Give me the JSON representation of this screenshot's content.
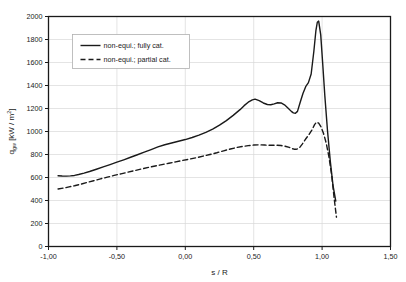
{
  "chart_data": {
    "type": "line",
    "title": "",
    "xlabel": "s / R",
    "ylabel": "q_gw [kW / m^2]",
    "ylabel_main": "q",
    "ylabel_sub": "gw",
    "ylabel_unit_open": " [kW / m",
    "ylabel_unit_sup": "2",
    "ylabel_unit_close": "]",
    "xlim": [
      -1.0,
      1.5
    ],
    "ylim": [
      0,
      2000
    ],
    "grid": true,
    "grid_color": "#d9d9d9",
    "axis_color": "#1a1a1a",
    "background": "#ffffff",
    "legend_position": "upper-left-inside",
    "xticks": [
      -1.0,
      -0.5,
      0.0,
      0.5,
      1.0,
      1.5
    ],
    "xticklabels": [
      "-1,00",
      "-0,50",
      "0,00",
      "0,50",
      "1,00",
      "1,50"
    ],
    "yticks": [
      0,
      200,
      400,
      600,
      800,
      1000,
      1200,
      1400,
      1600,
      1800,
      2000
    ],
    "yticklabels": [
      "0",
      "200",
      "400",
      "600",
      "800",
      "1000",
      "1200",
      "1400",
      "1600",
      "1800",
      "2000"
    ],
    "series": [
      {
        "name": "non-equi.; fully cat.",
        "style": "solid",
        "color": "#1a1a1a",
        "width": 1.4,
        "x": [
          -0.93,
          -0.9,
          -0.87,
          -0.84,
          -0.81,
          -0.78,
          -0.74,
          -0.7,
          -0.65,
          -0.6,
          -0.55,
          -0.5,
          -0.45,
          -0.4,
          -0.35,
          -0.3,
          -0.25,
          -0.2,
          -0.15,
          -0.1,
          -0.05,
          0.0,
          0.05,
          0.1,
          0.15,
          0.2,
          0.25,
          0.3,
          0.35,
          0.4,
          0.43,
          0.46,
          0.49,
          0.51,
          0.54,
          0.57,
          0.6,
          0.625,
          0.65,
          0.675,
          0.7,
          0.725,
          0.75,
          0.775,
          0.79,
          0.805,
          0.82,
          0.84,
          0.86,
          0.88,
          0.9,
          0.92,
          0.94,
          0.955,
          0.965,
          0.975,
          0.99,
          1.005,
          1.02,
          1.04,
          1.06,
          1.08,
          1.1
        ],
        "y": [
          615,
          613,
          612,
          614,
          618,
          626,
          638,
          652,
          672,
          692,
          712,
          733,
          754,
          776,
          798,
          820,
          843,
          866,
          885,
          900,
          915,
          930,
          948,
          968,
          992,
          1020,
          1055,
          1095,
          1140,
          1190,
          1225,
          1255,
          1275,
          1281,
          1268,
          1248,
          1235,
          1233,
          1240,
          1250,
          1248,
          1232,
          1205,
          1175,
          1162,
          1158,
          1175,
          1255,
          1330,
          1390,
          1425,
          1500,
          1700,
          1880,
          1950,
          1960,
          1840,
          1580,
          1310,
          1000,
          740,
          530,
          395
        ]
      },
      {
        "name": "non-equi.; partial cat.",
        "style": "dashed",
        "color": "#1a1a1a",
        "width": 1.4,
        "dash": "5,3",
        "x": [
          -0.93,
          -0.89,
          -0.85,
          -0.81,
          -0.77,
          -0.72,
          -0.67,
          -0.62,
          -0.57,
          -0.52,
          -0.47,
          -0.42,
          -0.37,
          -0.32,
          -0.27,
          -0.22,
          -0.17,
          -0.12,
          -0.07,
          -0.02,
          0.03,
          0.08,
          0.13,
          0.18,
          0.23,
          0.28,
          0.33,
          0.38,
          0.42,
          0.46,
          0.5,
          0.54,
          0.58,
          0.62,
          0.66,
          0.7,
          0.73,
          0.76,
          0.78,
          0.795,
          0.81,
          0.83,
          0.855,
          0.88,
          0.905,
          0.925,
          0.945,
          0.96,
          0.975,
          0.99,
          1.01,
          1.03,
          1.05,
          1.07,
          1.09,
          1.105
        ],
        "y": [
          500,
          508,
          518,
          528,
          540,
          556,
          572,
          588,
          603,
          618,
          632,
          646,
          660,
          674,
          688,
          700,
          712,
          724,
          736,
          748,
          760,
          772,
          786,
          800,
          815,
          832,
          848,
          862,
          870,
          877,
          882,
          884,
          882,
          880,
          881,
          878,
          872,
          862,
          852,
          846,
          845,
          852,
          890,
          935,
          975,
          1012,
          1060,
          1082,
          1072,
          1045,
          985,
          900,
          780,
          620,
          400,
          255
        ]
      }
    ]
  },
  "legend": {
    "entries": [
      {
        "label": "non-equi.; fully cat.",
        "style": "solid"
      },
      {
        "label": "non-equi.; partial cat.",
        "style": "dashed"
      }
    ]
  }
}
